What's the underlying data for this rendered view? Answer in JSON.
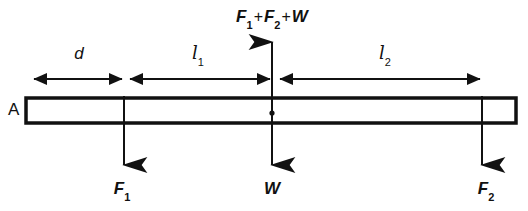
{
  "figure": {
    "type": "free-body-diagram",
    "support_label": "A",
    "reaction_label": {
      "symbol_1": "F",
      "sub_1": "1",
      "plus_1": "+",
      "symbol_2": "F",
      "sub_2": "2",
      "plus_2": "+",
      "symbol_3": "W",
      "full_text": "F1 + F2 + W"
    },
    "dimensions": [
      {
        "name": "d",
        "label": "d",
        "subscript": "",
        "from_x": 32,
        "to_x": 124
      },
      {
        "name": "l1",
        "label": "l",
        "subscript": "1",
        "from_x": 124,
        "to_x": 272
      },
      {
        "name": "l2",
        "label": "l",
        "subscript": "2",
        "from_x": 272,
        "to_x": 482
      }
    ],
    "forces": [
      {
        "name": "F1",
        "label": "F",
        "subscript": "1",
        "direction": "down",
        "x": 124
      },
      {
        "name": "W",
        "label": "W",
        "subscript": "",
        "direction": "down",
        "x": 272
      },
      {
        "name": "F2",
        "label": "F",
        "subscript": "2",
        "direction": "down",
        "x": 482
      },
      {
        "name": "R",
        "label": "F1 + F2 + W",
        "subscript": "",
        "direction": "up",
        "x": 272
      }
    ],
    "beam": {
      "left_x": 26,
      "right_x": 516,
      "top_y": 98,
      "bottom_y": 123,
      "center_of_mass_x": 272,
      "center_of_mass_y": 113
    },
    "colors": {
      "stroke": "#111111",
      "background": "#ffffff"
    }
  }
}
